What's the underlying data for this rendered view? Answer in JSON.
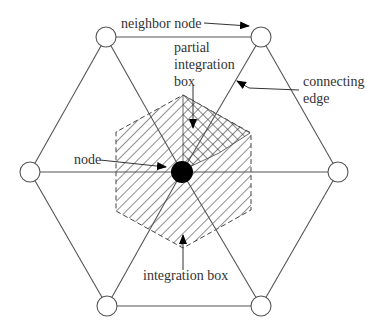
{
  "diagram": {
    "type": "hexagonal mesh integration box",
    "labels": {
      "neighbor_node": "neighbor node",
      "partial_integration_box_line1": "partial",
      "partial_integration_box_line2": "integration",
      "partial_integration_box_line3": "box",
      "connecting_edge_line1": "connecting",
      "connecting_edge_line2": "edge",
      "node": "node",
      "integration_box": "integration box"
    },
    "nodes": [
      {
        "id": "top-left",
        "x": 106,
        "y": 37
      },
      {
        "id": "top-right",
        "x": 261,
        "y": 37
      },
      {
        "id": "left",
        "x": 30,
        "y": 172
      },
      {
        "id": "right",
        "x": 338,
        "y": 172
      },
      {
        "id": "bottom-left",
        "x": 107,
        "y": 306
      },
      {
        "id": "bottom-right",
        "x": 261,
        "y": 306
      }
    ],
    "center_node": {
      "x": 182,
      "y": 172
    },
    "colors": {
      "line": "#555555",
      "text": "#333333",
      "node_fill": "#ffffff",
      "center_fill": "#000000"
    }
  }
}
